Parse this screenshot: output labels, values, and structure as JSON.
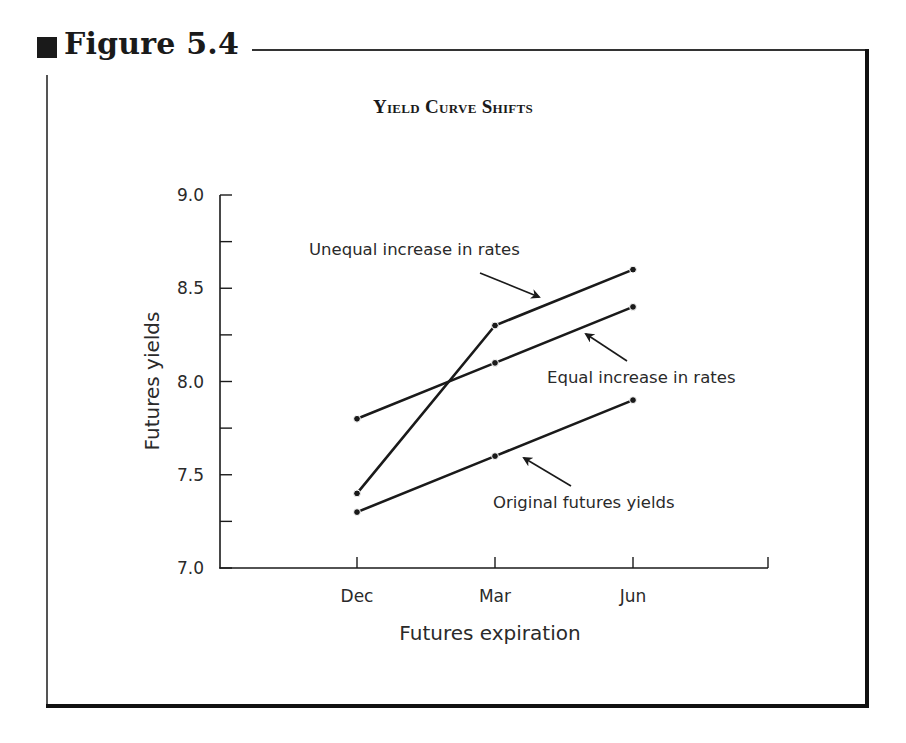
{
  "figure": {
    "label": "Figure 5.4"
  },
  "chart_data": {
    "type": "line",
    "title": "Yield Curve Shifts",
    "xlabel": "Futures expiration",
    "ylabel": "Futures yields",
    "categories": [
      "Dec",
      "Mar",
      "Jun"
    ],
    "ylim": [
      7.0,
      9.0
    ],
    "yticks": [
      "7.0",
      "7.5",
      "8.0",
      "8.5",
      "9.0"
    ],
    "minor_ytick_step": 0.25,
    "grid": false,
    "legend": "none (inline annotations with arrows)",
    "series": [
      {
        "name": "Original futures yields",
        "values": [
          7.3,
          7.6,
          7.9
        ]
      },
      {
        "name": "Equal increase in rates",
        "values": [
          7.8,
          8.1,
          8.4
        ]
      },
      {
        "name": "Unequal increase in rates",
        "values": [
          7.4,
          8.3,
          8.6
        ]
      }
    ],
    "annotations": [
      {
        "text": "Unequal increase in rates",
        "points_to": "Unequal increase in rates"
      },
      {
        "text": "Equal increase in rates",
        "points_to": "Equal increase in rates"
      },
      {
        "text": "Original futures yields",
        "points_to": "Original futures yields"
      }
    ]
  }
}
